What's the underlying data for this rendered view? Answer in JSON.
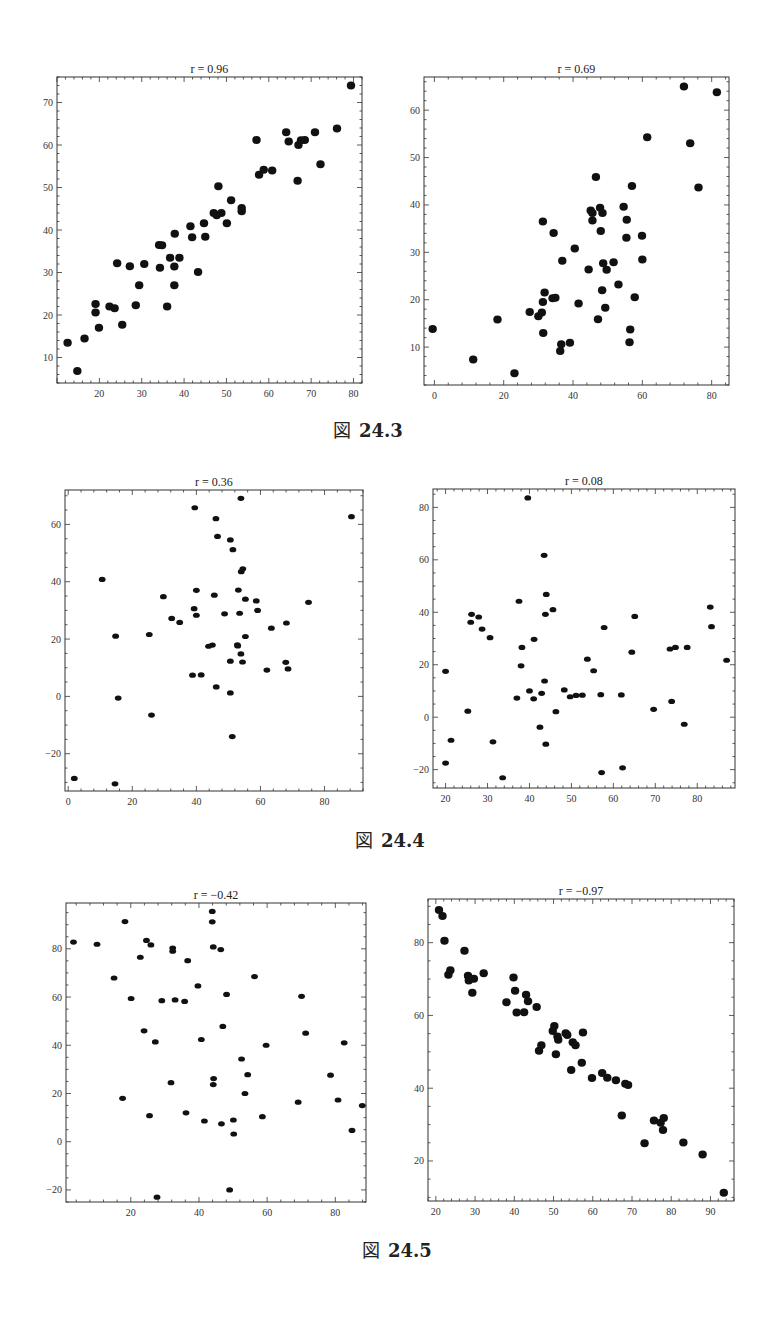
{
  "figures": [
    {
      "caption_glyph": "図",
      "caption_number": "24.3"
    },
    {
      "caption_glyph": "図",
      "caption_number": "24.4"
    },
    {
      "caption_glyph": "図",
      "caption_number": "24.5"
    }
  ],
  "chart_data": [
    {
      "type": "scatter",
      "figure": "図 24.3",
      "title": "r = 0.96",
      "xlabel": "",
      "ylabel": "",
      "xlim": [
        10,
        82
      ],
      "ylim": [
        4,
        76
      ],
      "xticks": [
        20,
        30,
        40,
        50,
        60,
        70,
        80
      ],
      "yticks": [
        10,
        20,
        30,
        40,
        50,
        60,
        70
      ],
      "grid": false,
      "marker": "large",
      "points": [
        [
          12.5,
          13.5
        ],
        [
          14.8,
          6.8
        ],
        [
          16.5,
          14.5
        ],
        [
          19.1,
          22.6
        ],
        [
          19.1,
          20.6
        ],
        [
          19.9,
          17
        ],
        [
          22.4,
          22
        ],
        [
          23.6,
          21.6
        ],
        [
          24.2,
          32.2
        ],
        [
          25.4,
          17.7
        ],
        [
          27.2,
          31.5
        ],
        [
          28.6,
          22.3
        ],
        [
          29.4,
          27
        ],
        [
          30.6,
          32
        ],
        [
          34.1,
          36.5
        ],
        [
          34.3,
          31.1
        ],
        [
          34.8,
          36.4
        ],
        [
          36,
          22
        ],
        [
          36.7,
          33.5
        ],
        [
          37.7,
          31.4
        ],
        [
          37.7,
          27
        ],
        [
          37.8,
          39.1
        ],
        [
          38.9,
          33.5
        ],
        [
          41.5,
          40.9
        ],
        [
          41.9,
          38.3
        ],
        [
          43.3,
          30.1
        ],
        [
          44.7,
          41.6
        ],
        [
          45,
          38.4
        ],
        [
          47,
          44
        ],
        [
          47.7,
          43.5
        ],
        [
          48.1,
          50.3
        ],
        [
          48.8,
          44
        ],
        [
          50.1,
          41.6
        ],
        [
          51.1,
          47
        ],
        [
          53.6,
          45.2
        ],
        [
          53.6,
          44.4
        ],
        [
          57.1,
          61.2
        ],
        [
          57.7,
          53
        ],
        [
          58.8,
          54.2
        ],
        [
          60.8,
          54
        ],
        [
          64.1,
          63
        ],
        [
          64.7,
          60.8
        ],
        [
          66.8,
          51.6
        ],
        [
          67,
          60
        ],
        [
          67.6,
          61.1
        ],
        [
          68.5,
          61.2
        ],
        [
          70.9,
          63
        ],
        [
          72.2,
          55.5
        ],
        [
          76.1,
          63.9
        ],
        [
          79.4,
          74
        ]
      ]
    },
    {
      "type": "scatter",
      "figure": "図 24.3",
      "title": "r = 0.69",
      "xlabel": "",
      "ylabel": "",
      "xlim": [
        -3,
        85
      ],
      "ylim": [
        2,
        67
      ],
      "xticks": [
        0,
        20,
        40,
        60,
        80
      ],
      "yticks": [
        10,
        20,
        30,
        40,
        50,
        60
      ],
      "grid": false,
      "marker": "large",
      "points": [
        [
          -0.5,
          13.8
        ],
        [
          11.2,
          7.4
        ],
        [
          18.2,
          15.8
        ],
        [
          23.1,
          4.5
        ],
        [
          27.5,
          17.4
        ],
        [
          30,
          16.5
        ],
        [
          31,
          17.3
        ],
        [
          31.3,
          19.5
        ],
        [
          31.3,
          36.5
        ],
        [
          31.4,
          13
        ],
        [
          31.8,
          21.5
        ],
        [
          34.1,
          20.3
        ],
        [
          34.4,
          34.1
        ],
        [
          34.9,
          20.4
        ],
        [
          36.3,
          9.2
        ],
        [
          36.6,
          10.6
        ],
        [
          36.9,
          28.2
        ],
        [
          39.1,
          10.9
        ],
        [
          40.5,
          30.8
        ],
        [
          41.6,
          19.2
        ],
        [
          44.5,
          26.4
        ],
        [
          45.1,
          38.8
        ],
        [
          45.6,
          38.3
        ],
        [
          45.6,
          36.7
        ],
        [
          46.6,
          45.9
        ],
        [
          47.2,
          15.9
        ],
        [
          47.8,
          39.4
        ],
        [
          48,
          34.5
        ],
        [
          48.4,
          22
        ],
        [
          48.5,
          38.3
        ],
        [
          48.7,
          27.7
        ],
        [
          49.3,
          18.3
        ],
        [
          49.7,
          26.3
        ],
        [
          51.7,
          27.9
        ],
        [
          53.1,
          23.2
        ],
        [
          54.6,
          39.6
        ],
        [
          55.4,
          33.1
        ],
        [
          55.5,
          36.9
        ],
        [
          56.3,
          11
        ],
        [
          56.5,
          13.7
        ],
        [
          57,
          44
        ],
        [
          57.8,
          20.5
        ],
        [
          59.9,
          33.5
        ],
        [
          60,
          28.5
        ],
        [
          61.4,
          54.3
        ],
        [
          72,
          65
        ],
        [
          73.8,
          53
        ],
        [
          76.2,
          43.7
        ],
        [
          81.5,
          63.8
        ]
      ]
    },
    {
      "type": "scatter",
      "figure": "図 24.4",
      "title": "r = 0.36",
      "xlabel": "",
      "ylabel": "",
      "xlim": [
        -1,
        92
      ],
      "ylim": [
        -33,
        72
      ],
      "xticks": [
        0,
        20,
        40,
        60,
        80
      ],
      "yticks": [
        -20,
        0,
        20,
        40,
        60
      ],
      "grid": false,
      "marker": "small",
      "points": [
        [
          1.9,
          -28.6
        ],
        [
          10.6,
          40.8
        ],
        [
          14.6,
          -30.5
        ],
        [
          14.8,
          21
        ],
        [
          15.6,
          -0.6
        ],
        [
          26,
          -6.5
        ],
        [
          25.3,
          21.6
        ],
        [
          29.7,
          34.8
        ],
        [
          32.3,
          27.2
        ],
        [
          34.8,
          25.8
        ],
        [
          38.8,
          7.4
        ],
        [
          39.3,
          30.6
        ],
        [
          39.5,
          65.8
        ],
        [
          40,
          37
        ],
        [
          40,
          28.3
        ],
        [
          41.5,
          7.5
        ],
        [
          43.8,
          17.5
        ],
        [
          45,
          17.9
        ],
        [
          45.6,
          35.3
        ],
        [
          46.1,
          62
        ],
        [
          46.2,
          3.3
        ],
        [
          46.6,
          55.8
        ],
        [
          48.8,
          28.8
        ],
        [
          50.6,
          54.6
        ],
        [
          50.6,
          12.3
        ],
        [
          50.6,
          1.2
        ],
        [
          51.2,
          -14
        ],
        [
          51.4,
          51.2
        ],
        [
          52.8,
          18
        ],
        [
          52.9,
          17.6
        ],
        [
          53.1,
          37.1
        ],
        [
          53.5,
          29
        ],
        [
          53.9,
          69.1
        ],
        [
          53.9,
          14.8
        ],
        [
          54,
          43.5
        ],
        [
          54.4,
          12
        ],
        [
          54.5,
          44.5
        ],
        [
          55.3,
          33.9
        ],
        [
          55.3,
          20.9
        ],
        [
          58.7,
          33.3
        ],
        [
          59.1,
          30
        ],
        [
          62,
          9.2
        ],
        [
          63.4,
          23.8
        ],
        [
          67.9,
          11.9
        ],
        [
          68.1,
          25.6
        ],
        [
          68.6,
          9.6
        ],
        [
          75,
          32.8
        ],
        [
          88.4,
          62.7
        ]
      ]
    },
    {
      "type": "scatter",
      "figure": "図 24.4",
      "title": "r = 0.08",
      "xlabel": "",
      "ylabel": "",
      "xlim": [
        17,
        89
      ],
      "ylim": [
        -27,
        87
      ],
      "xticks": [
        20,
        30,
        40,
        50,
        60,
        70,
        80
      ],
      "yticks": [
        -20,
        0,
        20,
        40,
        60,
        80
      ],
      "grid": false,
      "marker": "small",
      "points": [
        [
          20,
          -17.5
        ],
        [
          20,
          17.5
        ],
        [
          21.3,
          -8.8
        ],
        [
          25.3,
          2.3
        ],
        [
          26,
          36.2
        ],
        [
          26.2,
          39.2
        ],
        [
          27.9,
          38.2
        ],
        [
          28.7,
          33.6
        ],
        [
          30.6,
          30.3
        ],
        [
          31.3,
          -9.4
        ],
        [
          33.6,
          -23.1
        ],
        [
          37,
          7.3
        ],
        [
          37.5,
          44.2
        ],
        [
          38,
          19.6
        ],
        [
          38.2,
          26.6
        ],
        [
          39.6,
          83.6
        ],
        [
          40,
          10
        ],
        [
          41.1,
          29.7
        ],
        [
          41,
          7
        ],
        [
          42.5,
          -3.8
        ],
        [
          42.9,
          9.1
        ],
        [
          43.6,
          13.8
        ],
        [
          43.8,
          39.2
        ],
        [
          43.5,
          61.7
        ],
        [
          44,
          46.8
        ],
        [
          43.9,
          -10.3
        ],
        [
          45.6,
          41
        ],
        [
          46.3,
          2.1
        ],
        [
          48.3,
          10.4
        ],
        [
          49.7,
          7.8
        ],
        [
          51.1,
          8.3
        ],
        [
          52.6,
          8.4
        ],
        [
          53.8,
          22.1
        ],
        [
          55.3,
          17.7
        ],
        [
          57,
          8.6
        ],
        [
          57.2,
          -21.1
        ],
        [
          57.8,
          34.2
        ],
        [
          61.9,
          8.5
        ],
        [
          62.2,
          -19.3
        ],
        [
          64.4,
          24.8
        ],
        [
          65.1,
          38.4
        ],
        [
          69.6,
          3
        ],
        [
          73.5,
          26
        ],
        [
          73.9,
          6
        ],
        [
          74.8,
          26.6
        ],
        [
          76.9,
          -2.7
        ],
        [
          77.6,
          26.6
        ],
        [
          87,
          21.7
        ],
        [
          83.1,
          42
        ],
        [
          83.4,
          34.5
        ]
      ]
    },
    {
      "type": "scatter",
      "figure": "図 24.5",
      "title": "r = −0.42",
      "xlabel": "",
      "ylabel": "",
      "xlim": [
        1,
        89
      ],
      "ylim": [
        -25,
        99
      ],
      "xticks": [
        20,
        40,
        60,
        80
      ],
      "yticks": [
        -20,
        0,
        20,
        40,
        60,
        80
      ],
      "grid": false,
      "marker": "small",
      "points": [
        [
          3.2,
          82.8
        ],
        [
          10.1,
          81.9
        ],
        [
          15.1,
          67.9
        ],
        [
          17.6,
          18
        ],
        [
          18.3,
          91.3
        ],
        [
          20.1,
          59.4
        ],
        [
          22.8,
          76.5
        ],
        [
          23.9,
          46
        ],
        [
          24.6,
          83.5
        ],
        [
          25.5,
          10.8
        ],
        [
          25.9,
          81.6
        ],
        [
          27.2,
          41.4
        ],
        [
          27.7,
          -23
        ],
        [
          29.1,
          58.5
        ],
        [
          31.8,
          24.5
        ],
        [
          32.3,
          80.3
        ],
        [
          32.3,
          79
        ],
        [
          33,
          58.8
        ],
        [
          35.8,
          58.2
        ],
        [
          36.7,
          75.1
        ],
        [
          36.2,
          12
        ],
        [
          39.7,
          64.6
        ],
        [
          40.7,
          42.4
        ],
        [
          41.6,
          8.6
        ],
        [
          43.9,
          91.2
        ],
        [
          43.9,
          95.5
        ],
        [
          44.2,
          80.8
        ],
        [
          44.3,
          26.2
        ],
        [
          44.2,
          23.7
        ],
        [
          46.4,
          79.7
        ],
        [
          46.6,
          7.4
        ],
        [
          47,
          47.8
        ],
        [
          48.1,
          61.1
        ],
        [
          49,
          -20
        ],
        [
          50.1,
          9
        ],
        [
          50.2,
          3.2
        ],
        [
          52.5,
          34.3
        ],
        [
          53.5,
          20
        ],
        [
          54.3,
          27.8
        ],
        [
          56.3,
          68.5
        ],
        [
          59.7,
          40
        ],
        [
          58.6,
          10.4
        ],
        [
          69.1,
          16.4
        ],
        [
          70.1,
          60.3
        ],
        [
          71.3,
          45
        ],
        [
          78.6,
          27.6
        ],
        [
          80.8,
          17.3
        ],
        [
          82.6,
          41
        ],
        [
          84.9,
          4.7
        ],
        [
          87.9,
          15
        ]
      ]
    },
    {
      "type": "scatter",
      "figure": "図 24.5",
      "title": "r = −0.97",
      "xlabel": "",
      "ylabel": "",
      "xlim": [
        18,
        96
      ],
      "ylim": [
        9,
        92
      ],
      "xticks": [
        20,
        30,
        40,
        50,
        60,
        70,
        80,
        90
      ],
      "yticks": [
        20,
        40,
        60,
        80
      ],
      "grid": false,
      "marker": "large",
      "points": [
        [
          20.8,
          89
        ],
        [
          21.7,
          87.3
        ],
        [
          22.2,
          80.5
        ],
        [
          23.2,
          71.2
        ],
        [
          23.7,
          72.4
        ],
        [
          27.3,
          77.8
        ],
        [
          28.2,
          70.9
        ],
        [
          28.4,
          69.6
        ],
        [
          29.3,
          66.2
        ],
        [
          29.7,
          70.1
        ],
        [
          32.2,
          71.6
        ],
        [
          38,
          63.6
        ],
        [
          39.8,
          70.4
        ],
        [
          40.2,
          66.8
        ],
        [
          40.6,
          60.8
        ],
        [
          42.5,
          60.9
        ],
        [
          43,
          65.7
        ],
        [
          43.5,
          63.9
        ],
        [
          45.7,
          62.3
        ],
        [
          46.3,
          50.3
        ],
        [
          46.9,
          51.8
        ],
        [
          49.8,
          55.7
        ],
        [
          50.6,
          49.3
        ],
        [
          50.2,
          57.1
        ],
        [
          51,
          54.2
        ],
        [
          51.2,
          53.3
        ],
        [
          53.1,
          55.1
        ],
        [
          53.5,
          54.6
        ],
        [
          54.5,
          45
        ],
        [
          54.9,
          52.6
        ],
        [
          55.6,
          51.8
        ],
        [
          57.5,
          55.3
        ],
        [
          57.2,
          47
        ],
        [
          59.8,
          42.8
        ],
        [
          62.4,
          44.2
        ],
        [
          63.7,
          42.9
        ],
        [
          65.9,
          42.2
        ],
        [
          67.4,
          32.5
        ],
        [
          68.3,
          41.2
        ],
        [
          69,
          40.9
        ],
        [
          73.2,
          24.9
        ],
        [
          75.6,
          31.1
        ],
        [
          77.3,
          30.5
        ],
        [
          77.9,
          28.5
        ],
        [
          78.1,
          31.8
        ],
        [
          83.1,
          25.1
        ],
        [
          88,
          21.8
        ],
        [
          93.4,
          11.3
        ]
      ]
    }
  ]
}
